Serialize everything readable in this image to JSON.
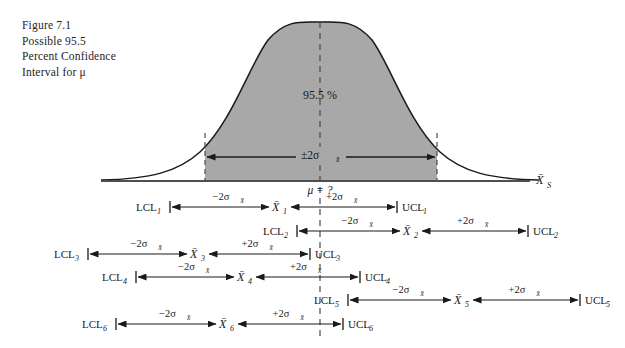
{
  "caption": {
    "lines": [
      "Figure 7.1",
      "Possible 95.5",
      "Percent Confidence",
      "Interval for μ"
    ]
  },
  "curve": {
    "area_label": "95.5 %",
    "width_label": "±2σ",
    "width_label_sub": "x̄",
    "center_label": "μ = ?",
    "axis_label": "X̄",
    "axis_label_sub": "S"
  },
  "labels": {
    "minus": "−2σ",
    "plus": "+2σ",
    "sigma_sub": "x̄",
    "mean_symbol": "X̄"
  },
  "intervals": [
    {
      "lcl": "LCL",
      "lcl_sub": "1",
      "mean": "X̄",
      "mean_sub": "1",
      "ucl": "UCL",
      "ucl_sub": "1",
      "left_label": "−2σ",
      "right_label": "+2σ",
      "x_lcl": 170,
      "x_mean": 281,
      "x_ucl": 397,
      "y": 207
    },
    {
      "lcl": "LCL",
      "lcl_sub": "2",
      "mean": "X̄",
      "mean_sub": "2",
      "ucl": "UCL",
      "ucl_sub": "2",
      "left_label": "−2σ",
      "right_label": "+2σ",
      "x_lcl": 297,
      "x_mean": 412,
      "x_ucl": 528,
      "y": 231
    },
    {
      "lcl": "LCL",
      "lcl_sub": "3",
      "mean": "X̄",
      "mean_sub": "3",
      "ucl": "UCL",
      "ucl_sub": "3",
      "left_label": "−2σ",
      "right_label": "+2σ",
      "x_lcl": 88,
      "x_mean": 199,
      "x_ucl": 310,
      "y": 254
    },
    {
      "lcl": "LCL",
      "lcl_sub": "4",
      "mean": "X̄",
      "mean_sub": "4",
      "ucl": "UCL",
      "ucl_sub": "4",
      "left_label": "−2σ",
      "right_label": "+2σ",
      "x_lcl": 136,
      "x_mean": 246,
      "x_ucl": 360,
      "y": 277
    },
    {
      "lcl": "LCL",
      "lcl_sub": "5",
      "mean": "X̄",
      "mean_sub": "5",
      "ucl": "UCL",
      "ucl_sub": "5",
      "left_label": "−2σ",
      "right_label": "+2σ",
      "x_lcl": 348,
      "x_mean": 463,
      "x_ucl": 580,
      "y": 300
    },
    {
      "lcl": "LCL",
      "lcl_sub": "6",
      "mean": "X̄",
      "mean_sub": "6",
      "ucl": "UCL",
      "ucl_sub": "6",
      "left_label": "−2σ",
      "right_label": "+2σ",
      "x_lcl": 116,
      "x_mean": 228,
      "x_ucl": 343,
      "y": 324
    }
  ],
  "geometry": {
    "baseline_y": 181,
    "baseline_x1": 101,
    "baseline_x2": 530,
    "center_x": 320,
    "shade_left_x": 205,
    "shade_right_x": 437,
    "peak_y": 22,
    "dash_bottom_y": 336
  },
  "colors": {
    "shade": "#a8a8a8",
    "line": "#1a1a1a",
    "dash": "#4a4a4a"
  }
}
